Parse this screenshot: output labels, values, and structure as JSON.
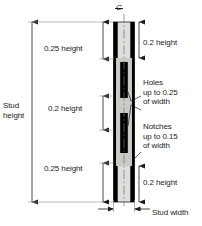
{
  "diagram": {
    "centerline_symbol": "C",
    "centerline_name": "centerline",
    "labels": {
      "stud_height": "Stud\nheight",
      "top_segment": "0.25 height",
      "middle_segment": "0.2 height",
      "bottom_segment": "0.25 height",
      "top_right_segment": "0.2 height",
      "bottom_right_segment": "0.2 height",
      "holes": "Holes\nup to 0.25\nof width",
      "notches": "Notches\nup to 0.15\nof width",
      "stud_width": "Stud width"
    },
    "values": {
      "top_segment_fraction": 0.25,
      "middle_segment_fraction": 0.2,
      "bottom_segment_fraction": 0.25,
      "top_right_fraction": 0.2,
      "bottom_right_fraction": 0.2,
      "hole_max_fraction_of_width": 0.25,
      "notch_max_fraction_of_width": 0.15
    },
    "colors": {
      "flange": "#000000",
      "web": "#c8c8c4",
      "web_light": "#dededa",
      "line": "#1d1d1d",
      "background": "#ffffff"
    }
  }
}
